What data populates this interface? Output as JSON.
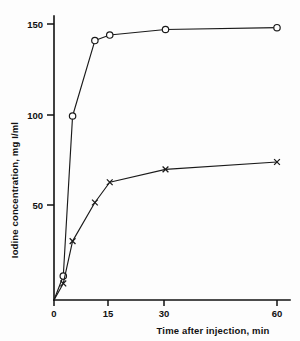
{
  "chart_data": {
    "type": "line",
    "title": "",
    "xlabel": "Time after injection, min",
    "ylabel": "Iodine concentration, mg I/ml",
    "xlim": [
      0,
      63
    ],
    "ylim": [
      0,
      158
    ],
    "xticks": [
      0,
      15,
      30,
      60
    ],
    "xticklabels": [
      "0",
      "15",
      "30",
      "60"
    ],
    "yticks": [
      50,
      100,
      150
    ],
    "yticklabels": [
      "50",
      "100",
      "150"
    ],
    "grid": false,
    "legend": "none",
    "series": [
      {
        "name": "high-dose",
        "marker": "open-circle",
        "x": [
          0,
          2.5,
          5,
          11,
          15,
          30,
          60
        ],
        "y": [
          0,
          13,
          100,
          141,
          144,
          147,
          148
        ]
      },
      {
        "name": "low-dose",
        "marker": "cross",
        "x": [
          0,
          2.5,
          5,
          11,
          15,
          30,
          60
        ],
        "y": [
          0,
          9,
          32,
          53,
          64,
          71,
          75
        ]
      }
    ]
  },
  "axes": {
    "y_title": "Iodine concentration, mg I/ml",
    "x_title": "Time after injection, min",
    "y_tick_labels": [
      "150",
      "100",
      "50"
    ],
    "x_tick_labels": [
      "0",
      "15",
      "30",
      "60"
    ]
  }
}
